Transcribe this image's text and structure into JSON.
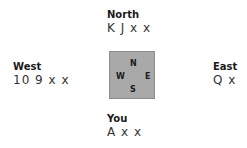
{
  "hands": {
    "north": {
      "label": "North",
      "cards": "K J x x"
    },
    "west": {
      "label": "West",
      "cards": "10 9 x x"
    },
    "east": {
      "label": "East",
      "cards": "Q x"
    },
    "south": {
      "label": "You",
      "cards": "A x x"
    }
  },
  "table": {
    "n": "N",
    "s": "S",
    "w": "W",
    "e": "E",
    "color": "#a9a9a9"
  }
}
